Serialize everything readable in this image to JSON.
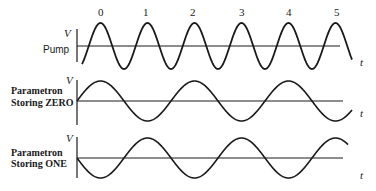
{
  "figure": {
    "panels": [
      {
        "id": "pump",
        "label_lines": [
          "Pump"
        ],
        "y_axis_label": "V",
        "x_axis_label": "t"
      },
      {
        "id": "zero",
        "label_lines": [
          "Parametron",
          "Storing ZERO"
        ],
        "y_axis_label": "V",
        "x_axis_label": "t"
      },
      {
        "id": "one",
        "label_lines": [
          "Parametron",
          "Storing ONE"
        ],
        "y_axis_label": "V",
        "x_axis_label": "t"
      }
    ],
    "pump_peak_labels": [
      "0",
      "1",
      "2",
      "3",
      "4",
      "5"
    ],
    "colors": {
      "ink": "#1a1a1a",
      "background": "#ffffff"
    }
  },
  "chart_data": [
    {
      "type": "line",
      "title": "Pump",
      "xlabel": "t",
      "ylabel": "V",
      "description": "Pump sinusoid at frequency 2f; peaks labeled 0 through 5",
      "annotations": [
        "0",
        "1",
        "2",
        "3",
        "4",
        "5"
      ],
      "relative_frequency": 2,
      "phase": "peaks at labeled positions 0–5",
      "grid": false
    },
    {
      "type": "line",
      "title": "Parametron Storing ZERO",
      "xlabel": "t",
      "ylabel": "V",
      "description": "Oscillation at half the pump frequency, starting at zero and rising (phase 0)",
      "relative_frequency": 1,
      "phase_deg": 0,
      "grid": false
    },
    {
      "type": "line",
      "title": "Parametron Storing ONE",
      "xlabel": "t",
      "ylabel": "V",
      "description": "Oscillation at half the pump frequency, starting at zero and falling (phase 180°)",
      "relative_frequency": 1,
      "phase_deg": 180,
      "grid": false
    }
  ]
}
